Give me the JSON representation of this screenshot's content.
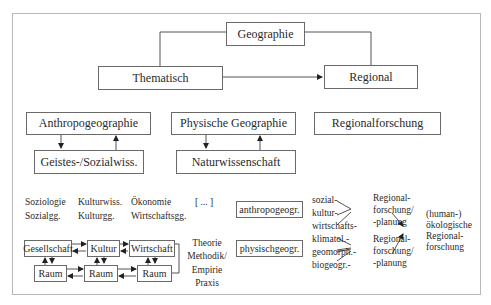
{
  "diagram": {
    "root": "Geographie",
    "level1": {
      "left": "Thematisch",
      "right": "Regional"
    },
    "level2": {
      "anthropo": "Anthropogeographie",
      "physisch": "Physische Geographie",
      "regional": "Regionalforschung"
    },
    "level3": {
      "geistes": "Geistes-/Sozialwiss.",
      "natur": "Naturwissenschaft"
    },
    "disciplines": {
      "row1": [
        "Soziologie",
        "Kulturwiss.",
        "Ökonomie",
        "[ ... ]"
      ],
      "row2": [
        "Sozialgg.",
        "Kulturgg.",
        "Wirtschaftsgg."
      ]
    },
    "system": {
      "top": [
        "Gesellschaft",
        "Kultur",
        "Wirtschaft"
      ],
      "bottom": [
        "Raum",
        "Raum",
        "Raum"
      ]
    },
    "methods": [
      "Theorie",
      "Methodik/",
      "Empirie",
      "Praxis"
    ],
    "subfields": {
      "anthropo": "anthropogeogr.",
      "physisch": "physischgeogr."
    },
    "anthro_branches": [
      "sozial-",
      "kultur-",
      "wirtschafts-"
    ],
    "phys_branches": [
      "klimatol.-",
      "geomorph.-",
      "biogeogr.-"
    ],
    "regional_planning": [
      "Regional-",
      "forschung/",
      "-planung"
    ],
    "outcome": [
      "(human-)",
      "ökologische",
      "Regional-",
      "forschung"
    ]
  }
}
